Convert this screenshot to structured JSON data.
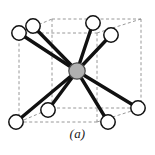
{
  "figure": {
    "caption": "(a)",
    "background_color": "#ffffff"
  },
  "style": {
    "cell_edge_color": "#8c8c8c",
    "cell_edge_dash": "3,2.4",
    "cell_edge_width": 0.9,
    "bond_color": "#111111",
    "bond_width": 3.4,
    "corner_atom_fill": "#ffffff",
    "corner_atom_stroke": "#111111",
    "corner_atom_stroke_width": 1.5,
    "corner_atom_radius": 7.2,
    "center_atom_fill": "#b0b0b0",
    "center_atom_stroke": "#4a4a4a",
    "center_atom_stroke_width": 1.2,
    "center_atom_radius": 8.2
  },
  "unit_cell": {
    "label": "dashed cubic unit cell",
    "front_face": [
      {
        "name": "front-top-left",
        "x": 19,
        "y": 33
      },
      {
        "name": "front-top-right",
        "x": 97,
        "y": 33
      },
      {
        "name": "front-bottom-right",
        "x": 97,
        "y": 122
      },
      {
        "name": "front-bottom-left",
        "x": 19,
        "y": 122
      }
    ],
    "back_face": [
      {
        "name": "back-top-left",
        "x": 52,
        "y": 19
      },
      {
        "name": "back-top-right",
        "x": 141,
        "y": 19
      },
      {
        "name": "back-bottom-right",
        "x": 141,
        "y": 108
      },
      {
        "name": "back-bottom-left",
        "x": 52,
        "y": 108
      }
    ],
    "connectors": [
      {
        "from": "front-top-left",
        "to": "back-top-left"
      },
      {
        "from": "front-top-right",
        "to": "back-top-right"
      },
      {
        "from": "front-bottom-right",
        "to": "back-bottom-right"
      },
      {
        "from": "front-bottom-left",
        "to": "back-bottom-left"
      }
    ]
  },
  "atoms": {
    "center": {
      "name": "center-atom",
      "label": "body-center atom",
      "x": 77,
      "y": 71
    },
    "corners": [
      {
        "name": "corner-atom-top-left-back",
        "label": "corner atom 1",
        "x": 33,
        "y": 26
      },
      {
        "name": "corner-atom-top-center-back",
        "label": "corner atom 2",
        "x": 93,
        "y": 23
      },
      {
        "name": "corner-atom-top-right",
        "label": "corner atom 3",
        "x": 111,
        "y": 35
      },
      {
        "name": "corner-atom-right",
        "label": "corner atom 4",
        "x": 138,
        "y": 108
      },
      {
        "name": "corner-atom-bottom-right",
        "label": "corner atom 5",
        "x": 108,
        "y": 122
      },
      {
        "name": "corner-atom-bottom-center",
        "label": "corner atom 6",
        "x": 48,
        "y": 110
      },
      {
        "name": "corner-atom-bottom-left",
        "label": "corner atom 7",
        "x": 16,
        "y": 122
      },
      {
        "name": "corner-atom-left-front",
        "label": "corner atom 8",
        "x": 19,
        "y": 33
      }
    ]
  },
  "bonds": [
    {
      "name": "bond-to-corner-1",
      "to": "corner-atom-top-left-back"
    },
    {
      "name": "bond-to-corner-2",
      "to": "corner-atom-top-center-back"
    },
    {
      "name": "bond-to-corner-3",
      "to": "corner-atom-top-right"
    },
    {
      "name": "bond-to-corner-4",
      "to": "corner-atom-right"
    },
    {
      "name": "bond-to-corner-5",
      "to": "corner-atom-bottom-right"
    },
    {
      "name": "bond-to-corner-6",
      "to": "corner-atom-bottom-center"
    },
    {
      "name": "bond-to-corner-7",
      "to": "corner-atom-bottom-left"
    },
    {
      "name": "bond-to-corner-8",
      "to": "corner-atom-left-front"
    }
  ]
}
